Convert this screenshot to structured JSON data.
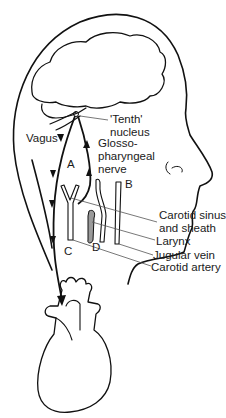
{
  "figure": {
    "labels": {
      "tenth_nucleus_line1": "'Tenth'",
      "tenth_nucleus_line2": "nucleus",
      "vagus": "Vagus",
      "glosso_line1": "Glosso-",
      "glosso_line2": "pharyngeal",
      "glosso_line3": "nerve",
      "letter_a": "A",
      "letter_b": "B",
      "letter_c": "C",
      "letter_d": "D",
      "carotid_sinus_line1": "Carotid sinus",
      "carotid_sinus_line2": "and sheath",
      "larynx": "Larynx",
      "jugular_vein": "Jugular vein",
      "carotid_artery": "Carotid artery"
    },
    "colors": {
      "line": "#111111",
      "leader": "#555555",
      "larynx_fill": "#9a9a9a",
      "background": "#ffffff"
    }
  }
}
